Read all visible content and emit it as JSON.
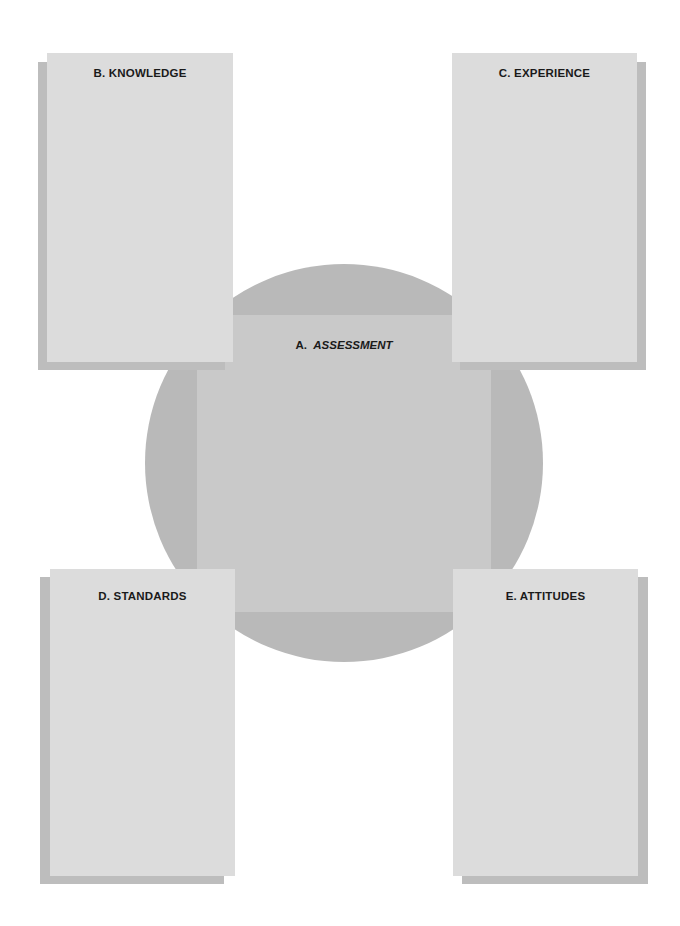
{
  "diagram": {
    "center": {
      "letter": "A.",
      "title": "ASSESSMENT"
    },
    "boxes": [
      {
        "id": "B",
        "label": "B.  KNOWLEDGE",
        "position": "top-left"
      },
      {
        "id": "C",
        "label": "C.  EXPERIENCE",
        "position": "top-right"
      },
      {
        "id": "D",
        "label": "D.  STANDARDS",
        "position": "bottom-left"
      },
      {
        "id": "E",
        "label": "E.  ATTITUDES",
        "position": "bottom-right"
      }
    ],
    "colors": {
      "panel": "#dcdcdc",
      "shadow": "#bdbdbd",
      "circle": "#b9b9b9",
      "center_square": "#c9c9c9",
      "text": "#1a1a1a"
    }
  }
}
